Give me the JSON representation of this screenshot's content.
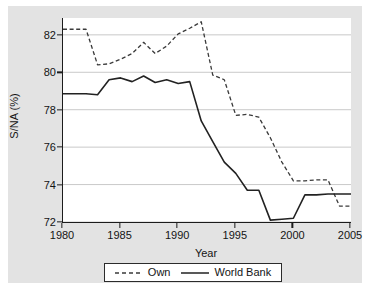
{
  "chart_data": {
    "type": "line",
    "title": "",
    "xlabel": "Year",
    "ylabel": "S/NA (%)",
    "xlim": [
      1980,
      2005
    ],
    "ylim": [
      72,
      82.9
    ],
    "xticks": [
      1980,
      1985,
      1990,
      1995,
      2000,
      2005
    ],
    "yticks": [
      72,
      74,
      76,
      78,
      80,
      82
    ],
    "grid": true,
    "grid_axis": "y",
    "legend_position": "bottom",
    "x": [
      1980,
      1981,
      1982,
      1983,
      1984,
      1985,
      1986,
      1987,
      1988,
      1989,
      1990,
      1991,
      1992,
      1993,
      1994,
      1995,
      1996,
      1997,
      1998,
      1999,
      2000,
      2001,
      2002,
      2003,
      2004,
      2005
    ],
    "series": [
      {
        "name": "Own",
        "style": "dashed",
        "color": "#3a3a3a",
        "values": [
          82.3,
          82.3,
          82.3,
          80.4,
          80.45,
          80.7,
          81.0,
          81.6,
          81.0,
          81.4,
          82.05,
          82.35,
          82.7,
          79.85,
          79.6,
          77.7,
          77.75,
          77.6,
          76.5,
          75.2,
          74.2,
          74.2,
          74.25,
          74.25,
          72.85,
          72.85
        ]
      },
      {
        "name": "World Bank",
        "style": "solid",
        "color": "#222222",
        "values": [
          78.85,
          78.85,
          78.85,
          78.8,
          79.6,
          79.7,
          79.5,
          79.8,
          79.45,
          79.6,
          79.4,
          79.5,
          77.4,
          76.3,
          75.2,
          74.6,
          73.7,
          73.7,
          72.1,
          72.15,
          72.2,
          73.45,
          73.45,
          73.5,
          73.5,
          73.5
        ]
      }
    ],
    "annotations": []
  },
  "legend": {
    "items": [
      {
        "label": "Own",
        "style": "dashed"
      },
      {
        "label": "World Bank",
        "style": "solid"
      }
    ]
  },
  "colors": {
    "figure_background": "#e3e3e3",
    "plot_background": "#ffffff",
    "axis": "#1c1c1c",
    "gridline": "#c9c9c9",
    "text": "#141414"
  }
}
